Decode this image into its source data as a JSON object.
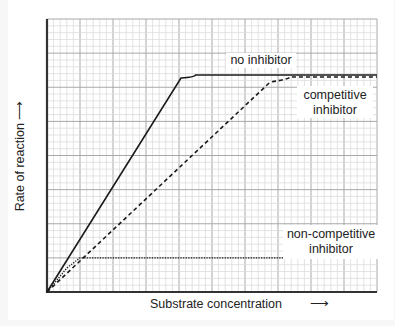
{
  "chart_data": {
    "type": "line",
    "title": "",
    "xlabel": "Substrate concentration",
    "ylabel": "Rate of reaction",
    "x_axis_arrow": true,
    "y_axis_arrow": true,
    "tick_labels": false,
    "grid": {
      "on": true,
      "major_x_divisions": 10,
      "major_y_divisions": 8,
      "minor_per_major": 5
    },
    "xlim": [
      0,
      10
    ],
    "ylim": [
      0,
      8
    ],
    "series": [
      {
        "name": "no inhibitor",
        "style": "solid",
        "points": [
          [
            0,
            0
          ],
          [
            4.06,
            6.27
          ],
          [
            4.5,
            6.36
          ],
          [
            10,
            6.36
          ]
        ]
      },
      {
        "name": "competitive inhibitor",
        "style": "dashed",
        "points": [
          [
            0,
            0
          ],
          [
            6.76,
            6.15
          ],
          [
            7.36,
            6.3
          ],
          [
            10,
            6.3
          ]
        ]
      },
      {
        "name": "non-competitive inhibitor",
        "style": "dotted",
        "points": [
          [
            0,
            0
          ],
          [
            0.6,
            0.7
          ],
          [
            1.0,
            1.0
          ],
          [
            10,
            1.0
          ]
        ]
      }
    ],
    "annotations": [
      "no inhibitor",
      "competitive inhibitor",
      "non-competitive inhibitor"
    ]
  },
  "labels": {
    "no_inhibitor": "no inhibitor",
    "competitive_1": "competitive",
    "competitive_2": "inhibitor",
    "noncompetitive_1": "non-competitive",
    "noncompetitive_2": "inhibitor",
    "xlabel": "Substrate concentration",
    "ylabel": "Rate of reaction"
  }
}
